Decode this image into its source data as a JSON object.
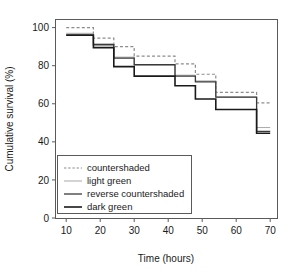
{
  "chart_data": {
    "type": "line",
    "subtype": "kaplan-meier-step",
    "title": "",
    "xlabel": "Time (hours)",
    "ylabel": "Cumulative survival (%)",
    "xlim": [
      7,
      72
    ],
    "ylim": [
      0,
      104
    ],
    "xticks": [
      10,
      20,
      30,
      40,
      50,
      60,
      70
    ],
    "xticklabels": [
      "10",
      "20",
      "30",
      "40",
      "50",
      "60",
      "70"
    ],
    "yticks": [
      0,
      20,
      40,
      60,
      80,
      100
    ],
    "yticklabels": [
      "0",
      "20",
      "40",
      "60",
      "80",
      "100"
    ],
    "grid": false,
    "legend_position": "lower left",
    "series": [
      {
        "name": "countershaded",
        "style": "dashed",
        "color": "#8c8c8c",
        "width": 1.2,
        "x": [
          10,
          18,
          24,
          30,
          42,
          48,
          54,
          66,
          70
        ],
        "y": [
          100,
          94.5,
          90,
          85,
          81,
          75.5,
          66,
          60.5,
          60.5
        ]
      },
      {
        "name": "light green",
        "style": "solid",
        "color": "#a8a8a8",
        "width": 1.0,
        "x": [
          10,
          18,
          24,
          30,
          42,
          48,
          54,
          66,
          70
        ],
        "y": [
          97,
          91.5,
          84.5,
          80.5,
          75,
          72,
          63.5,
          47.5,
          47.5
        ]
      },
      {
        "name": "reverse countershaded",
        "style": "solid",
        "color": "#3a3a3a",
        "width": 1.3,
        "x": [
          10,
          18,
          24,
          30,
          42,
          48,
          54,
          66,
          70
        ],
        "y": [
          96.2,
          91,
          84,
          80.5,
          74.5,
          71.5,
          63.5,
          45.5,
          45.5
        ]
      },
      {
        "name": "dark green",
        "style": "solid",
        "color": "#1a1a1a",
        "width": 1.6,
        "x": [
          10,
          18,
          24,
          30,
          42,
          48,
          54,
          66,
          70
        ],
        "y": [
          96,
          89.5,
          79.5,
          74.5,
          69.5,
          62.5,
          57,
          44.5,
          44.5
        ]
      }
    ],
    "legend_entries": [
      {
        "label": "countershaded",
        "style": "dashed",
        "color": "#8c8c8c"
      },
      {
        "label": "light green",
        "style": "solid",
        "color": "#a8a8a8"
      },
      {
        "label": "reverse countershaded",
        "style": "solid",
        "color": "#3a3a3a"
      },
      {
        "label": "dark green",
        "style": "solid",
        "color": "#1a1a1a"
      }
    ]
  }
}
